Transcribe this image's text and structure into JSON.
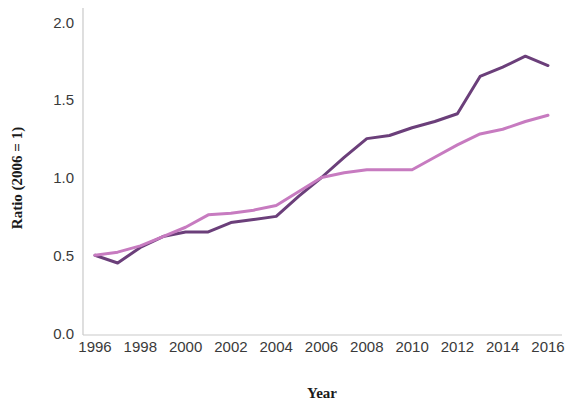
{
  "chart_data": {
    "type": "line",
    "title": "",
    "xlabel": "Year",
    "ylabel": "Ratio (2006 = 1)",
    "xlim": [
      1996,
      2016
    ],
    "ylim": [
      0.0,
      2.0
    ],
    "xticks": [
      1996,
      1998,
      2000,
      2002,
      2004,
      2006,
      2008,
      2010,
      2012,
      2014,
      2016
    ],
    "xtick_labels": [
      "1996",
      "1998",
      "2000",
      "2002",
      "2004",
      "2006",
      "2008",
      "2010",
      "2012",
      "2014",
      "2016"
    ],
    "yticks": [
      0.0,
      0.5,
      1.0,
      1.5,
      2.0
    ],
    "ytick_labels": [
      "0.0",
      "0.5",
      "1.0",
      "1.5",
      "2.0"
    ],
    "grid": false,
    "legend": "none",
    "x": [
      1996,
      1997,
      1998,
      1999,
      2000,
      2001,
      2002,
      2003,
      2004,
      2005,
      2006,
      2007,
      2008,
      2009,
      2010,
      2011,
      2012,
      2013,
      2014,
      2015,
      2016
    ],
    "series": [
      {
        "name": "dark-purple-series",
        "color": "#6B3F7A",
        "width": 3.0,
        "values": [
          0.5,
          0.45,
          0.55,
          0.62,
          0.65,
          0.65,
          0.71,
          0.73,
          0.75,
          0.88,
          1.0,
          1.13,
          1.25,
          1.27,
          1.32,
          1.36,
          1.41,
          1.65,
          1.71,
          1.78,
          1.72
        ]
      },
      {
        "name": "light-orchid-series",
        "color": "#C77BC0",
        "width": 3.0,
        "values": [
          0.5,
          0.52,
          0.56,
          0.62,
          0.68,
          0.76,
          0.77,
          0.79,
          0.82,
          0.91,
          1.0,
          1.03,
          1.05,
          1.05,
          1.05,
          1.13,
          1.21,
          1.28,
          1.31,
          1.36,
          1.4
        ]
      }
    ],
    "axis_color": "#c9c9c9",
    "tick_label_color": "#3a3a3a",
    "axis_title_color": "#1a1a1a"
  }
}
